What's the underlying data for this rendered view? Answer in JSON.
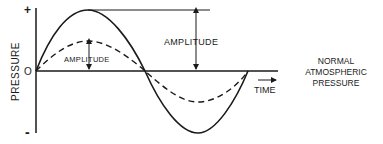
{
  "diagram": {
    "y_axis_label": "PRESSURE",
    "y_ticks": {
      "plus": "+",
      "zero": "O",
      "minus": "-"
    },
    "x_axis_label": "TIME",
    "baseline_label": [
      "NORMAL",
      "ATMOSPHERIC",
      "PRESSURE"
    ],
    "amplitude_large_label": "AMPLITUDE",
    "amplitude_small_label": "AMPLITUDE",
    "series": [
      {
        "name": "large-amplitude-wave",
        "style": "solid",
        "relative_amplitude": 1.0
      },
      {
        "name": "small-amplitude-wave",
        "style": "dashed",
        "relative_amplitude": 0.5
      }
    ],
    "colors": {
      "ink": "#1a1a1a",
      "background": "#ffffff"
    }
  }
}
